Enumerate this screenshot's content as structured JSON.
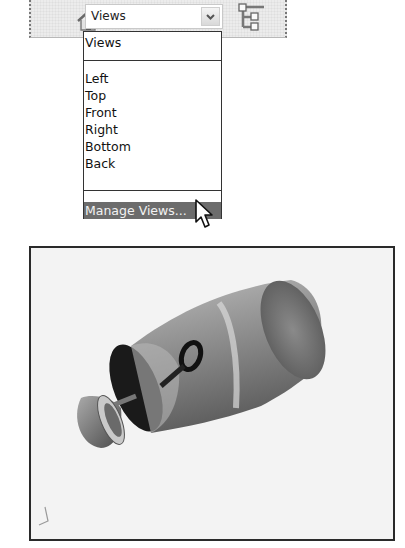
{
  "toolbar": {
    "home_icon": "home-icon",
    "views_combo": {
      "selected": "Views",
      "arrow_icon": "chevron-down-icon"
    },
    "tree_icon": "hierarchy-tree-icon"
  },
  "dropdown": {
    "header_item": "Views",
    "items": [
      "Left",
      "Top",
      "Front",
      "Right",
      "Bottom",
      "Back"
    ],
    "footer_item": "Manage Views...",
    "highlighted": "Manage Views..."
  },
  "cursor": "arrow-pointer-icon",
  "viewport": {
    "model": "exploded-capsule-3d-model",
    "triad": "axis-triad-icon"
  },
  "colors": {
    "toolbar_bg": "#ececec",
    "highlight_bg": "#6c6c6c",
    "viewport_bg": "#f3f3f3",
    "frame": "#2a2a2a"
  }
}
